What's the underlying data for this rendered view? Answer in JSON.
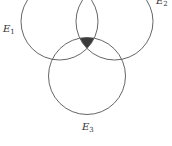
{
  "diagram": {
    "type": "venn",
    "sets": [
      {
        "id": "E1",
        "label": "E",
        "subscript": "1",
        "cx": 59.5,
        "cy": 21.5,
        "r": 38.5,
        "label_x": 7,
        "label_y": 32
      },
      {
        "id": "E2",
        "label": "E",
        "subscript": "2",
        "cx": 114.5,
        "cy": 21.5,
        "r": 38.5,
        "label_x": 157,
        "label_y": 5
      },
      {
        "id": "E3",
        "label": "E",
        "subscript": "3",
        "cx": 87,
        "cy": 76,
        "r": 38.5,
        "label_x": 81,
        "label_y": 131
      }
    ],
    "shaded_region": "E1 ∩ E2 ∩ E3",
    "colors": {
      "stroke": "#555555",
      "shade": "#3a3a3a",
      "background": "#ffffff"
    }
  }
}
